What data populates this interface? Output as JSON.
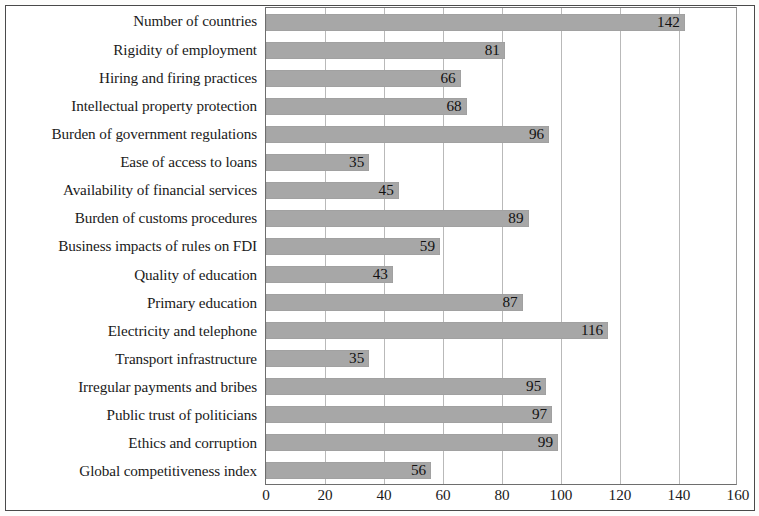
{
  "chart_data": {
    "type": "bar",
    "orientation": "horizontal",
    "title": "",
    "subtitle": "",
    "xlabel": "",
    "ylabel": "",
    "xlim": [
      0,
      160
    ],
    "xticks": [
      0,
      20,
      40,
      60,
      80,
      100,
      120,
      140,
      160
    ],
    "grid": true,
    "legend": null,
    "show_value_labels": true,
    "bar_color": "#a7a7a7",
    "categories": [
      "Number of countries",
      "Rigidity of employment",
      "Hiring and firing practices",
      "Intellectual property protection",
      "Burden of government regulations",
      "Ease of access to loans",
      "Availability of financial services",
      "Burden of customs procedures",
      "Business impacts of rules on FDI",
      "Quality of education",
      "Primary education",
      "Electricity and telephone",
      "Transport infrastructure",
      "Irregular payments and bribes",
      "Public trust of politicians",
      "Ethics and corruption",
      "Global competitiveness index"
    ],
    "values": [
      142,
      81,
      66,
      68,
      96,
      35,
      45,
      89,
      59,
      43,
      87,
      116,
      35,
      95,
      97,
      99,
      56
    ],
    "value_labels": [
      "142",
      "81",
      "66",
      "68",
      "96",
      "35",
      "45",
      "89",
      "59",
      "43",
      "87",
      "116",
      "35",
      "95",
      "97",
      "99",
      "56"
    ],
    "tick_labels": [
      "0",
      "20",
      "40",
      "60",
      "80",
      "100",
      "120",
      "140",
      "160"
    ]
  }
}
